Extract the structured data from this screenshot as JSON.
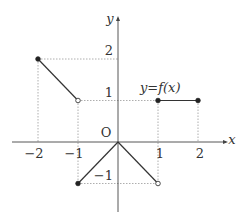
{
  "chart_data": {
    "type": "line",
    "title": "",
    "function_label": "y=f(x)",
    "xlabel": "x",
    "ylabel": "y",
    "origin_label": "O",
    "x_ticks": [
      {
        "value": -2,
        "label": "−2"
      },
      {
        "value": -1,
        "label": "−1"
      },
      {
        "value": 1,
        "label": "1"
      },
      {
        "value": 2,
        "label": "2"
      }
    ],
    "y_ticks": [
      {
        "value": 2,
        "label": "2"
      },
      {
        "value": 1,
        "label": "1"
      },
      {
        "value": -1,
        "label": "−1"
      }
    ],
    "segments": [
      {
        "from": [
          -2,
          2
        ],
        "to": [
          -1,
          1
        ],
        "start_closed": true,
        "end_closed": false
      },
      {
        "from": [
          -1,
          -1
        ],
        "to": [
          0,
          0
        ],
        "start_closed": true,
        "end_closed": true
      },
      {
        "from": [
          0,
          0
        ],
        "to": [
          1,
          -1
        ],
        "start_closed": true,
        "end_closed": false
      },
      {
        "from": [
          1,
          1
        ],
        "to": [
          2,
          1
        ],
        "start_closed": true,
        "end_closed": true
      }
    ],
    "guide_lines": "dotted",
    "xlim": [
      -2.6,
      2.6
    ],
    "ylim": [
      -1.6,
      2.9
    ]
  }
}
